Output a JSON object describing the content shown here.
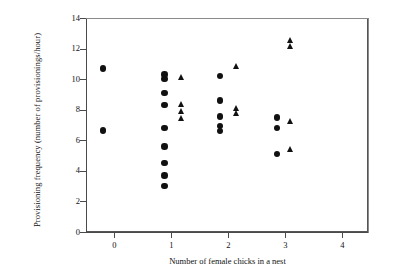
{
  "chart_data": {
    "type": "scatter",
    "title": "",
    "xlabel": "Number of female chicks in a nest",
    "ylabel": "Provisioning frequency (number of provisionings/hour)",
    "xlim": [
      -0.5,
      4.45
    ],
    "ylim": [
      0,
      14
    ],
    "xticks": [
      0,
      1,
      2,
      3,
      4
    ],
    "yticks": [
      0,
      2,
      4,
      6,
      8,
      10,
      12,
      14
    ],
    "grid": false,
    "legend": "none",
    "series": [
      {
        "name": "circle",
        "marker": "circle",
        "color": "#111111",
        "points": [
          {
            "x": -0.2,
            "y": 10.7
          },
          {
            "x": -0.2,
            "y": 6.65
          },
          {
            "x": 0.88,
            "y": 10.3
          },
          {
            "x": 0.88,
            "y": 10.0
          },
          {
            "x": 0.88,
            "y": 9.1
          },
          {
            "x": 0.88,
            "y": 8.3
          },
          {
            "x": 0.88,
            "y": 6.8
          },
          {
            "x": 0.88,
            "y": 5.6
          },
          {
            "x": 0.88,
            "y": 4.5
          },
          {
            "x": 0.88,
            "y": 3.7
          },
          {
            "x": 0.88,
            "y": 3.0
          },
          {
            "x": 1.85,
            "y": 10.2
          },
          {
            "x": 1.85,
            "y": 8.6
          },
          {
            "x": 1.85,
            "y": 7.55
          },
          {
            "x": 1.85,
            "y": 6.95
          },
          {
            "x": 1.85,
            "y": 6.6
          },
          {
            "x": 2.85,
            "y": 7.5
          },
          {
            "x": 2.85,
            "y": 6.8
          },
          {
            "x": 2.85,
            "y": 5.1
          }
        ]
      },
      {
        "name": "triangle",
        "marker": "triangle",
        "color": "#111111",
        "points": [
          {
            "x": 1.19,
            "y": 10.1
          },
          {
            "x": 1.19,
            "y": 8.35
          },
          {
            "x": 1.19,
            "y": 7.85
          },
          {
            "x": 1.19,
            "y": 7.45
          },
          {
            "x": 2.15,
            "y": 10.8
          },
          {
            "x": 2.15,
            "y": 8.1
          },
          {
            "x": 2.15,
            "y": 7.75
          },
          {
            "x": 3.1,
            "y": 12.5
          },
          {
            "x": 3.1,
            "y": 12.1
          },
          {
            "x": 3.1,
            "y": 7.2
          },
          {
            "x": 3.1,
            "y": 5.4
          }
        ]
      }
    ]
  },
  "axis": {
    "x_tick_labels": [
      "0",
      "1",
      "2",
      "3",
      "4"
    ],
    "y_tick_labels": [
      "0",
      "2",
      "4",
      "6",
      "8",
      "10",
      "12",
      "14"
    ],
    "x_title": "Number of female chicks in a nest",
    "y_title": "Provisioning frequency (number of provisionings/hour)"
  },
  "colors": {
    "marker": "#111111",
    "axis": "#4a4a4a",
    "frame": "#8a8a8a",
    "background": "#ffffff"
  }
}
